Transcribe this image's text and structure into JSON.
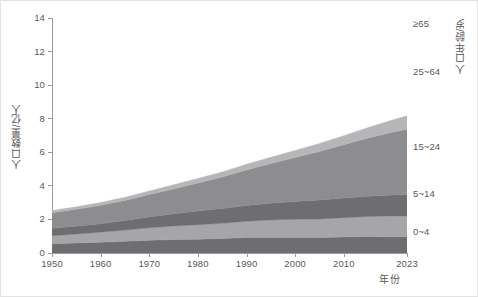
{
  "chart_data": {
    "type": "area",
    "title": "",
    "subtitle": "",
    "xlabel": "年份",
    "ylabel": "人口数量/亿人",
    "y2label": "人口年龄/岁",
    "stacked": true,
    "grid": false,
    "legend_position": "right-inline-labels",
    "xlim": [
      1950,
      2023
    ],
    "ylim": [
      0,
      14
    ],
    "y_ticks": [
      0,
      2,
      4,
      6,
      8,
      10,
      12,
      14
    ],
    "y_tick_labels": [
      "0",
      "2",
      "4",
      "6",
      "8",
      "10",
      "12",
      "14"
    ],
    "x_ticks": [
      1950,
      1960,
      1970,
      1980,
      1990,
      2000,
      2010,
      2023
    ],
    "x_tick_labels": [
      "1950",
      "1960",
      "1970",
      "1980",
      "1990",
      "2000",
      "2010",
      "2023"
    ],
    "x": [
      1950,
      1955,
      1960,
      1965,
      1970,
      1975,
      1980,
      1985,
      1990,
      1995,
      2000,
      2005,
      2010,
      2015,
      2020,
      2023
    ],
    "series": [
      {
        "name": "0~4",
        "label": "0~4",
        "color": "#6e6e70",
        "values": [
          0.55,
          0.6,
          0.64,
          0.7,
          0.76,
          0.8,
          0.82,
          0.87,
          0.92,
          0.92,
          0.92,
          0.93,
          0.96,
          0.98,
          0.97,
          0.96
        ]
      },
      {
        "name": "5~14",
        "label": "5~14",
        "color": "#a6a6a8",
        "values": [
          0.48,
          0.53,
          0.6,
          0.67,
          0.74,
          0.81,
          0.87,
          0.9,
          0.97,
          1.05,
          1.09,
          1.1,
          1.14,
          1.2,
          1.24,
          1.25
        ]
      },
      {
        "name": "15~24",
        "label": "15~24",
        "color": "#6e6e70",
        "values": [
          0.44,
          0.47,
          0.51,
          0.57,
          0.65,
          0.73,
          0.81,
          0.88,
          0.94,
          0.99,
          1.06,
          1.13,
          1.17,
          1.2,
          1.24,
          1.27
        ]
      },
      {
        "name": "25~64",
        "label": "25~64",
        "color": "#8d8d8f",
        "values": [
          0.93,
          1.0,
          1.09,
          1.19,
          1.33,
          1.48,
          1.67,
          1.88,
          2.12,
          2.37,
          2.62,
          2.89,
          3.18,
          3.47,
          3.74,
          3.89
        ]
      },
      {
        "name": "≥65",
        "label": "≥65",
        "color": "#b6b6b8",
        "values": [
          0.13,
          0.15,
          0.17,
          0.19,
          0.21,
          0.24,
          0.27,
          0.3,
          0.34,
          0.38,
          0.42,
          0.48,
          0.54,
          0.62,
          0.73,
          0.8
        ]
      }
    ],
    "totals": [
      2.53,
      2.75,
      3.01,
      3.32,
      3.69,
      4.06,
      4.44,
      4.83,
      5.29,
      5.71,
      6.11,
      6.53,
      6.99,
      7.47,
      7.92,
      8.17
    ],
    "band_labels": [
      {
        "text": "≥65",
        "top": 17
      },
      {
        "text": "25~64",
        "top": 65
      },
      {
        "text": "15~24",
        "top": 140
      },
      {
        "text": "5~14",
        "top": 187
      },
      {
        "text": "0~4",
        "top": 225
      }
    ],
    "colors": {
      "axis": "#9b9b9d",
      "text": "#58585a",
      "border": "#e3e3e3",
      "background": "#ffffff"
    }
  }
}
